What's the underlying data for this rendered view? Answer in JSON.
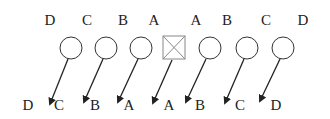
{
  "diagram": {
    "top_labels": [
      "D",
      "C",
      "B",
      "A",
      "A",
      "B",
      "C",
      "D"
    ],
    "bottom_labels": [
      "D",
      "C",
      "B",
      "A",
      "A",
      "B",
      "C",
      "D"
    ],
    "nodes": [
      {
        "shape": "circle",
        "type": "empty"
      },
      {
        "shape": "circle",
        "type": "empty"
      },
      {
        "shape": "circle",
        "type": "empty"
      },
      {
        "shape": "square",
        "type": "crossed"
      },
      {
        "shape": "circle",
        "type": "empty"
      },
      {
        "shape": "circle",
        "type": "empty"
      },
      {
        "shape": "circle",
        "type": "empty"
      }
    ],
    "colors": {
      "stroke": "#333333",
      "square_stroke": "#888888",
      "text": "#222222"
    }
  }
}
